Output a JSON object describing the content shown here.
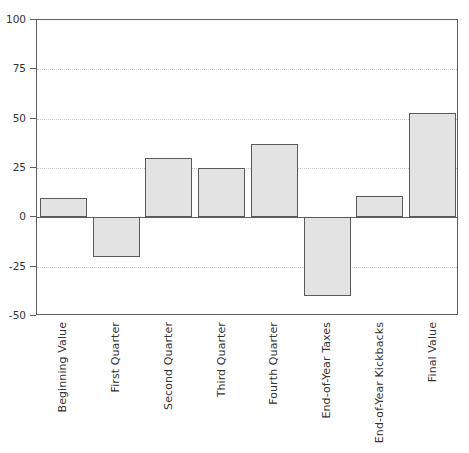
{
  "chart_data": {
    "type": "bar",
    "title": "",
    "xlabel": "",
    "ylabel": "",
    "ylim": [
      -50,
      100
    ],
    "yticks": [
      100,
      75,
      50,
      25,
      0,
      -25,
      -50
    ],
    "ytick_labels": [
      "100",
      "75",
      "50",
      "25",
      "0",
      "-25",
      "-50"
    ],
    "grid": true,
    "legend": false,
    "legend_position": "none",
    "categories": [
      "Beginning Value",
      "First Quarter",
      "Second Quarter",
      "Third Quarter",
      "Fourth Quarter",
      "End-of-Year Taxes",
      "End-of-Year Kickbacks",
      "Final Value"
    ],
    "values": [
      10,
      -20,
      30,
      25,
      37,
      -40,
      11,
      53
    ],
    "series": [
      {
        "name": "Value",
        "values": [
          10,
          -20,
          30,
          25,
          37,
          -40,
          11,
          53
        ]
      }
    ],
    "bar_fill_color": "#e3e3e3",
    "bar_edge_color": "#5a5a5a",
    "axis_color": "#5e5e5e",
    "grid_color": "#c8c8c8",
    "background_color": "#ffffff"
  }
}
